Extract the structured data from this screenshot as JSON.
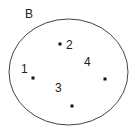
{
  "diagram": {
    "type": "set-diagram",
    "set": {
      "label": "B",
      "label_pos": [
        25,
        18
      ],
      "ellipse": {
        "cx": 68.5,
        "cy": 72,
        "rx": 59.5,
        "ry": 53
      },
      "stroke": "#444444"
    },
    "elements": [
      {
        "label": "1",
        "label_pos": [
          21,
          73
        ],
        "dot": [
          33,
          78
        ]
      },
      {
        "label": "2",
        "label_pos": [
          66,
          49
        ],
        "dot": [
          60,
          44
        ]
      },
      {
        "label": "3",
        "label_pos": [
          55,
          92
        ],
        "dot": [
          72,
          106
        ]
      },
      {
        "label": "4",
        "label_pos": [
          84,
          66
        ],
        "dot": [
          105,
          79
        ]
      }
    ],
    "dot_color": "#111111"
  }
}
